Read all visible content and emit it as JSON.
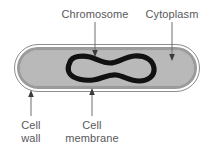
{
  "diagram": {
    "background_color": "#ffffff",
    "labels": {
      "chromosome": "Chromosome",
      "cytoplasm": "Cytoplasm",
      "cell_wall_line1": "Cell",
      "cell_wall_line2": "wall",
      "cell_membrane_line1": "Cell",
      "cell_membrane_line2": "membrane"
    },
    "colors": {
      "label_text": "#58585a",
      "leader_line": "#6e6e70",
      "arrow_head": "#3a3a3c",
      "cell_wall_stroke": "#8c8c8e",
      "cell_membrane": "#9b9b9d",
      "cytoplasm": "#b9b9b9",
      "chromosome": "#111111"
    },
    "parts": [
      {
        "name": "cell-wall",
        "label": "Cell wall",
        "pointer": "up"
      },
      {
        "name": "cell-membrane",
        "label": "Cell membrane",
        "pointer": "up"
      },
      {
        "name": "cytoplasm",
        "label": "Cytoplasm",
        "pointer": "down"
      },
      {
        "name": "chromosome",
        "label": "Chromosome",
        "pointer": "down"
      }
    ]
  }
}
